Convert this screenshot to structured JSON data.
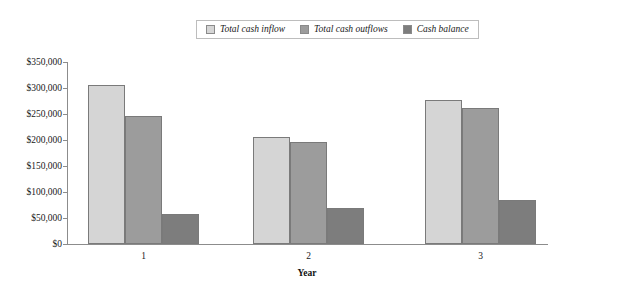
{
  "chart_data": {
    "type": "bar",
    "title": "",
    "xlabel": "Year",
    "ylabel": "",
    "categories": [
      "1",
      "2",
      "3"
    ],
    "series": [
      {
        "name": "Total cash inflow",
        "color": "#d5d5d5",
        "values": [
          305000,
          206000,
          276000
        ]
      },
      {
        "name": "Total cash outflows",
        "color": "#9c9c9c",
        "values": [
          246000,
          196000,
          262000
        ]
      },
      {
        "name": "Cash balance",
        "color": "#7d7d7d",
        "values": [
          58000,
          69000,
          85000
        ]
      }
    ],
    "ylim": [
      0,
      350000
    ],
    "ytick_values": [
      0,
      50000,
      100000,
      150000,
      200000,
      250000,
      300000,
      350000
    ],
    "ytick_labels": [
      "$0",
      "$50,000",
      "$100,000",
      "$150,000",
      "$200,000",
      "$250,000",
      "$300,000",
      "$350,000"
    ],
    "grid": false,
    "legend_position": "top-center",
    "legend_entries": [
      "Total cash inflow",
      "Total cash outflows",
      "Cash balance"
    ],
    "axis_color": "#8c8c8c",
    "bar_border_color": "#7a7a7a"
  }
}
